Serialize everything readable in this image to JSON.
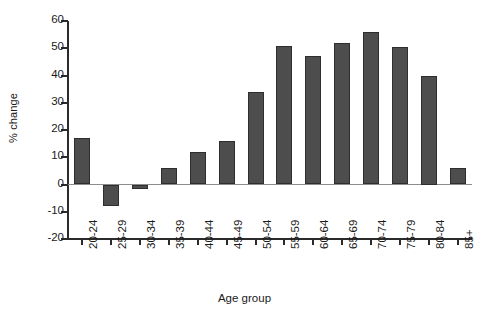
{
  "chart_data": {
    "type": "bar",
    "title": "",
    "xlabel": "Age group",
    "ylabel": "% change",
    "categories": [
      "20-24",
      "25-29",
      "30-34",
      "35-39",
      "40-44",
      "45-49",
      "50-54",
      "55-59",
      "60-64",
      "65-69",
      "70-74",
      "75-79",
      "80-84",
      "85+"
    ],
    "values": [
      17,
      -8,
      -1.5,
      6,
      12,
      16,
      34,
      51,
      47,
      52,
      56,
      50.5,
      40,
      6
    ],
    "ylim": [
      -20,
      60
    ],
    "ytick_labels": [
      "60",
      "50",
      "40",
      "30",
      "20",
      "10",
      "0",
      "-10",
      "-20"
    ],
    "ytick_values": [
      60,
      50,
      40,
      30,
      20,
      10,
      0,
      -10,
      -20
    ],
    "grid": false,
    "legend": null,
    "bar_color": "#4d4d4d",
    "bar_edge_color": "#2e2e2e",
    "axis_color": "#2b2b2b",
    "zero_line_color": "#8d8d8d",
    "background": "#ffffff"
  }
}
